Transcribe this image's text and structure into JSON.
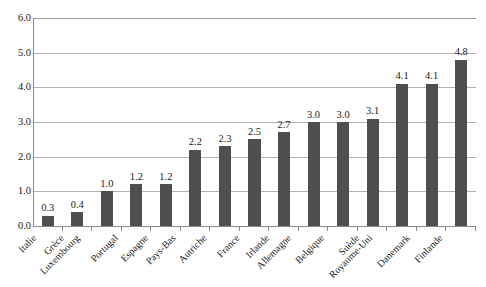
{
  "chart_data": {
    "type": "bar",
    "title": "",
    "subtitle": "",
    "xlabel": "",
    "ylabel": "",
    "ylim": [
      0.0,
      6.0
    ],
    "ytick_step": 1.0,
    "ytick_labels": [
      "6.0",
      "5.0",
      "4.0",
      "3.0",
      "2.0",
      "1.0",
      "0.0"
    ],
    "ytick_values": [
      6.0,
      5.0,
      4.0,
      3.0,
      2.0,
      1.0,
      0.0
    ],
    "grid": true,
    "grid_axis": "y",
    "legend": false,
    "legend_position": "none",
    "bar_color": "#4f4f4f",
    "gridline_color": "#b0b0b0",
    "axis_color": "#8a8a8a",
    "background_color": "#ffffff",
    "data_labels": true,
    "categories": [
      "Italie",
      "Grèce",
      "Luxembourg",
      "Portugal",
      "Espagne",
      "Pays-Bas",
      "Autriche",
      "France",
      "Irlande",
      "Allemagne",
      "Belgique",
      "Suède",
      "Royaume-Uni",
      "Danemark",
      "Finlande"
    ],
    "values": [
      0.3,
      0.4,
      1.0,
      1.2,
      1.2,
      2.2,
      2.3,
      2.5,
      2.7,
      3.0,
      3.0,
      3.1,
      4.1,
      4.1,
      4.8
    ],
    "value_labels": [
      "0.3",
      "0.4",
      "1.0",
      "1.2",
      "1.2",
      "2.2",
      "2.3",
      "2.5",
      "2.7",
      "3.0",
      "3.0",
      "3.1",
      "4.1",
      "4.1",
      "4.8"
    ]
  }
}
